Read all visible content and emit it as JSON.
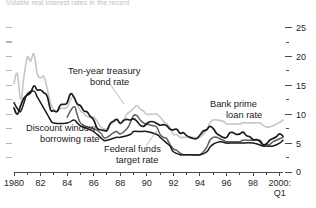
{
  "figure": {
    "title_partial": "Volatile real interest rates in the recent",
    "background_color": "#ffffff"
  },
  "chart_data": {
    "type": "line",
    "title": "Volatile real interest rates in the recent",
    "xlabel": "",
    "ylabel": "",
    "ylim": [
      0,
      27
    ],
    "xlim": [
      1980,
      2000.25
    ],
    "grid": false,
    "legend": "annotations-on-plot",
    "y_axis_side": "right",
    "y_ticks_major": [
      0,
      5,
      10,
      15,
      20,
      25
    ],
    "y_ticks_minor": [
      2.5,
      7.5,
      12.5,
      17.5,
      22.5
    ],
    "x_tick_labels": [
      "1980",
      "82",
      "84",
      "86",
      "88",
      "90",
      "92",
      "94",
      "96",
      "98",
      "2000:"
    ],
    "x_tick_sublabel": "Q1",
    "x_tick_values": [
      1980,
      1982,
      1984,
      1986,
      1988,
      1990,
      1992,
      1994,
      1996,
      1998,
      2000
    ],
    "annotations": [
      {
        "text_line1": "Ten-year treasury",
        "text_line2": "bond rate",
        "series": "ten-year-treasury-bond-rate"
      },
      {
        "text_line1": "Discount window",
        "text_line2": "borrowing rate",
        "series": "discount-window-borrowing-rate"
      },
      {
        "text_line1": "Federal funds",
        "text_line2": "target rate",
        "series": "federal-funds-target-rate"
      },
      {
        "text_line1": "Bank prime",
        "text_line2": "loan rate",
        "series": "bank-prime-loan-rate"
      }
    ],
    "series": [
      {
        "name": "Bank prime loan rate",
        "color": "#c6c6c6",
        "width": 1.6,
        "x": [
          1980.0,
          1980.25,
          1980.5,
          1980.75,
          1981.0,
          1981.25,
          1981.5,
          1981.75,
          1982.0,
          1982.25,
          1982.5,
          1982.75,
          1983.0,
          1983.25,
          1983.5,
          1983.75,
          1984.0,
          1984.25,
          1984.5,
          1984.75,
          1985.0,
          1985.25,
          1985.5,
          1985.75,
          1986.0,
          1986.25,
          1986.5,
          1986.75,
          1987.0,
          1987.25,
          1987.5,
          1987.75,
          1988.0,
          1988.25,
          1988.5,
          1988.75,
          1989.0,
          1989.25,
          1989.5,
          1989.75,
          1990.0,
          1990.25,
          1990.5,
          1990.75,
          1991.0,
          1991.25,
          1991.5,
          1991.75,
          1992.0,
          1992.25,
          1992.5,
          1992.75,
          1993.0,
          1993.5,
          1994.0,
          1994.5,
          1994.75,
          1995.0,
          1995.25,
          1995.75,
          1996.0,
          1996.25,
          1996.75,
          1997.0,
          1997.25,
          1997.75,
          1998.0,
          1998.5,
          1998.75,
          1999.0,
          1999.25,
          1999.5,
          1999.75,
          2000.0,
          2000.25
        ],
        "y": [
          15.3,
          17.0,
          12.6,
          16.5,
          19.8,
          19.2,
          20.4,
          17.0,
          16.3,
          16.5,
          14.4,
          11.9,
          10.8,
          10.5,
          11.0,
          11.0,
          11.2,
          12.4,
          13.0,
          11.8,
          10.6,
          10.2,
          9.6,
          9.5,
          9.5,
          8.8,
          7.9,
          7.5,
          7.5,
          8.2,
          8.7,
          9.0,
          8.6,
          9.0,
          10.0,
          10.5,
          11.0,
          11.5,
          10.9,
          10.5,
          10.0,
          10.0,
          10.0,
          10.0,
          9.5,
          8.8,
          8.3,
          7.6,
          6.5,
          6.5,
          6.0,
          6.0,
          6.0,
          6.0,
          6.0,
          7.3,
          8.5,
          9.0,
          9.0,
          8.8,
          8.3,
          8.3,
          8.3,
          8.3,
          8.5,
          8.5,
          8.5,
          8.5,
          8.1,
          7.8,
          7.8,
          8.0,
          8.3,
          8.6,
          9.0
        ]
      },
      {
        "name": "Ten-year treasury bond rate",
        "color": "#1a1a1a",
        "width": 1.7,
        "x": [
          1980.0,
          1980.25,
          1980.5,
          1980.75,
          1981.0,
          1981.25,
          1981.5,
          1981.75,
          1982.0,
          1982.25,
          1982.5,
          1982.75,
          1983.0,
          1983.25,
          1983.5,
          1983.75,
          1984.0,
          1984.25,
          1984.5,
          1984.75,
          1985.0,
          1985.25,
          1985.5,
          1985.75,
          1986.0,
          1986.25,
          1986.5,
          1986.75,
          1987.0,
          1987.25,
          1987.5,
          1987.75,
          1988.0,
          1988.25,
          1988.5,
          1988.75,
          1989.0,
          1989.25,
          1989.5,
          1989.75,
          1990.0,
          1990.25,
          1990.5,
          1990.75,
          1991.0,
          1991.25,
          1991.5,
          1991.75,
          1992.0,
          1992.25,
          1992.5,
          1992.75,
          1993.0,
          1993.25,
          1993.5,
          1993.75,
          1994.0,
          1994.25,
          1994.5,
          1994.75,
          1995.0,
          1995.25,
          1995.5,
          1995.75,
          1996.0,
          1996.25,
          1996.5,
          1996.75,
          1997.0,
          1997.25,
          1997.5,
          1997.75,
          1998.0,
          1998.25,
          1998.5,
          1998.75,
          1999.0,
          1999.25,
          1999.5,
          1999.75,
          2000.0,
          2000.25
        ],
        "y": [
          11.1,
          10.0,
          11.5,
          12.8,
          13.3,
          13.7,
          14.9,
          14.2,
          14.2,
          13.7,
          13.1,
          10.8,
          10.6,
          10.5,
          11.6,
          11.7,
          12.0,
          13.5,
          13.0,
          11.8,
          11.5,
          10.6,
          10.4,
          9.6,
          9.0,
          7.6,
          7.3,
          7.2,
          7.2,
          8.4,
          8.8,
          9.1,
          8.4,
          8.9,
          9.1,
          9.0,
          9.2,
          8.8,
          8.1,
          7.9,
          8.4,
          8.7,
          8.7,
          8.4,
          8.1,
          8.2,
          8.0,
          7.4,
          7.3,
          7.4,
          6.7,
          6.8,
          6.3,
          6.0,
          5.8,
          5.8,
          6.4,
          7.1,
          7.3,
          7.9,
          7.5,
          6.7,
          6.3,
          6.0,
          6.0,
          6.8,
          6.8,
          6.5,
          6.6,
          6.9,
          6.3,
          6.1,
          5.6,
          5.6,
          5.3,
          4.7,
          4.9,
          5.5,
          5.8,
          6.1,
          6.6,
          6.2
        ]
      },
      {
        "name": "Discount window borrowing rate",
        "color": "#1a1a1a",
        "width": 1.5,
        "x": [
          1980.0,
          1980.25,
          1980.5,
          1980.75,
          1981.0,
          1981.5,
          1981.75,
          1982.0,
          1982.5,
          1982.75,
          1983.0,
          1984.0,
          1984.5,
          1984.75,
          1985.0,
          1985.5,
          1986.0,
          1986.5,
          1986.75,
          1987.0,
          1987.75,
          1988.0,
          1988.75,
          1989.0,
          1989.5,
          1990.0,
          1990.75,
          1991.0,
          1991.25,
          1991.5,
          1991.75,
          1992.0,
          1992.5,
          1992.75,
          1993.0,
          1994.0,
          1994.5,
          1994.75,
          1995.0,
          1995.5,
          1996.0,
          1996.25,
          1997.0,
          1998.0,
          1998.75,
          1999.0,
          1999.5,
          2000.0,
          2000.25
        ],
        "y": [
          12.0,
          11.0,
          10.5,
          12.0,
          13.5,
          14.0,
          13.0,
          12.0,
          10.0,
          9.0,
          8.5,
          8.5,
          9.0,
          8.5,
          8.0,
          7.5,
          7.0,
          6.0,
          5.5,
          5.5,
          6.0,
          6.0,
          6.5,
          7.0,
          7.0,
          7.0,
          6.5,
          6.0,
          5.5,
          5.0,
          4.5,
          3.5,
          3.0,
          3.0,
          3.0,
          3.0,
          3.5,
          4.3,
          4.8,
          5.25,
          5.0,
          5.0,
          5.0,
          5.0,
          4.5,
          4.5,
          4.5,
          5.0,
          5.5
        ]
      },
      {
        "name": "Federal funds target rate",
        "color": "#5f5f5f",
        "width": 1.5,
        "x": [
          1984.0,
          1984.5,
          1984.75,
          1985.0,
          1985.5,
          1986.0,
          1986.5,
          1986.75,
          1987.0,
          1987.5,
          1987.75,
          1988.0,
          1988.5,
          1988.75,
          1989.0,
          1989.25,
          1989.5,
          1989.75,
          1990.0,
          1990.5,
          1990.75,
          1991.0,
          1991.25,
          1991.5,
          1991.75,
          1992.0,
          1992.25,
          1992.5,
          1992.75,
          1993.0,
          1993.5,
          1994.0,
          1994.25,
          1994.5,
          1994.75,
          1995.0,
          1995.25,
          1995.5,
          1995.75,
          1996.0,
          1996.25,
          1996.75,
          1997.0,
          1997.25,
          1997.75,
          1998.0,
          1998.5,
          1998.75,
          1999.0,
          1999.25,
          1999.5,
          1999.75,
          2000.0,
          2000.25
        ],
        "y": [
          9.5,
          11.3,
          10.0,
          8.5,
          7.8,
          7.5,
          6.8,
          6.0,
          6.0,
          6.8,
          7.0,
          6.6,
          7.5,
          8.5,
          9.75,
          9.75,
          9.0,
          8.5,
          8.25,
          8.0,
          7.75,
          6.5,
          6.0,
          5.75,
          4.75,
          4.0,
          3.75,
          3.25,
          3.0,
          3.0,
          3.0,
          3.0,
          3.5,
          4.25,
          5.5,
          6.0,
          6.0,
          5.75,
          5.5,
          5.25,
          5.25,
          5.25,
          5.25,
          5.5,
          5.5,
          5.5,
          5.5,
          4.75,
          4.75,
          4.75,
          5.25,
          5.5,
          5.75,
          6.0
        ]
      }
    ]
  }
}
